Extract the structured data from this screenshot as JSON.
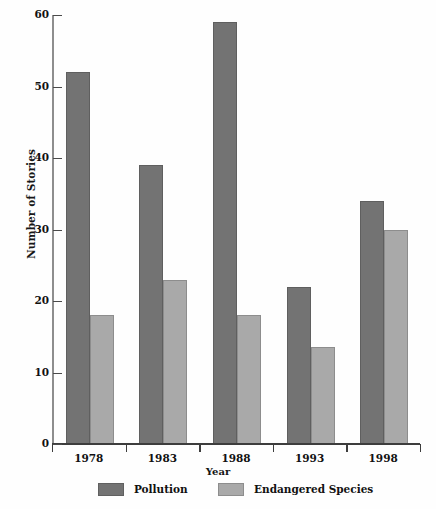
{
  "chart_data": {
    "type": "bar",
    "title": "",
    "subtitle": "",
    "xlabel": "Year",
    "ylabel": "Number of Stories",
    "categories": [
      "1978",
      "1983",
      "1988",
      "1993",
      "1998"
    ],
    "series": [
      {
        "name": "Pollution",
        "color": "#737373",
        "values": [
          52,
          39,
          59,
          22,
          34
        ]
      },
      {
        "name": "Endangered Species",
        "color": "#a9a9a9",
        "values": [
          18,
          23,
          18,
          13.5,
          30
        ]
      }
    ],
    "ylim": [
      0,
      60
    ],
    "ytick_values": [
      0,
      10,
      20,
      30,
      40,
      50,
      60
    ],
    "ytick_labels": [
      "0",
      "10",
      "20",
      "30",
      "40",
      "50",
      "60"
    ],
    "grid": false,
    "legend_position": "bottom",
    "axis_color": "#3d3d3d",
    "background_color": "#ffffff"
  },
  "legend": {
    "entries": [
      {
        "label": "Pollution"
      },
      {
        "label": "Endangered Species"
      }
    ]
  }
}
